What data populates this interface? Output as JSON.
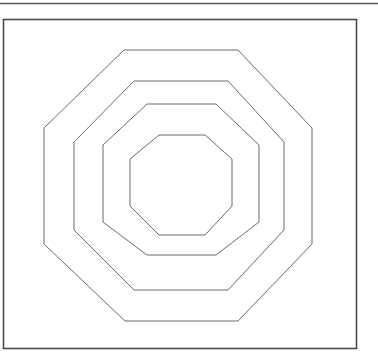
{
  "document": {
    "title": "Nested Octagons Line Drawing",
    "background_color": "#ffffff"
  },
  "top_rule": {
    "name": "horizontal-rule",
    "color": "#5a5a5a",
    "x1": 0,
    "y1": 3.5,
    "x2": 378,
    "y2": 3.5,
    "stroke_width": 1.6
  },
  "frame": {
    "name": "outer-rectangle-frame",
    "color": "#4a4a4a",
    "x": 3.5,
    "y": 19.5,
    "width": 353,
    "height": 329,
    "stroke_width": 1.6
  },
  "chart_data": {
    "type": "scatter",
    "xlabel": "",
    "ylabel": "",
    "grid": false,
    "legend": "none",
    "center": [
      181,
      185
    ],
    "shape_count": 4,
    "shapes": [
      {
        "name": "octagon-outer",
        "index": 1,
        "stroke": "#6b6b6b",
        "stroke_width": 1.0,
        "points": "124,50 238,50 312,128 312,244 238,321 125,321 44,244 44,128"
      },
      {
        "name": "octagon-second",
        "index": 2,
        "stroke": "#6b6b6b",
        "stroke_width": 1.0,
        "points": "134,81 228,81 284,142 284,230 228,290 134,290 74,230 74,142"
      },
      {
        "name": "octagon-third",
        "index": 3,
        "stroke": "#6b6b6b",
        "stroke_width": 1.0,
        "points": "147,104 216,104 259,145 259,222 216,255 147,255 103,222 103,145"
      },
      {
        "name": "octagon-inner",
        "index": 4,
        "stroke": "#6b6b6b",
        "stroke_width": 1.0,
        "points": "159,135 205,135 232,159 232,206 205,235 159,235 130,206 130,159"
      }
    ]
  }
}
